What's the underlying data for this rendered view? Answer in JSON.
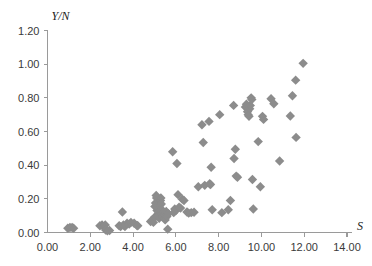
{
  "chart_data": {
    "type": "scatter",
    "title": "",
    "subtitle": "",
    "xlabel": "S",
    "ylabel": "Y/N",
    "xlim": [
      0.0,
      14.0
    ],
    "ylim": [
      0.0,
      1.2
    ],
    "xticks": [
      0.0,
      2.0,
      4.0,
      6.0,
      8.0,
      10.0,
      12.0,
      14.0
    ],
    "yticks": [
      0.0,
      0.2,
      0.4,
      0.6,
      0.8,
      1.0,
      1.2
    ],
    "xtick_labels": [
      "0.00",
      "2.00",
      "4.00",
      "6.00",
      "8.00",
      "10.00",
      "12.00",
      "14.00"
    ],
    "ytick_labels": [
      "0.00",
      "0.20",
      "0.40",
      "0.60",
      "0.80",
      "1.00",
      "1.20"
    ],
    "grid": false,
    "legend": null,
    "legend_position": "none",
    "marker": "diamond",
    "marker_color": "#8c8c8c",
    "marker_size": 7,
    "axis_color": "#9a9a9a",
    "series": [
      {
        "name": "observations",
        "points": [
          [
            0.95,
            0.025
          ],
          [
            1.05,
            0.03
          ],
          [
            1.15,
            0.03
          ],
          [
            1.22,
            0.025
          ],
          [
            2.45,
            0.04
          ],
          [
            2.55,
            0.045
          ],
          [
            2.62,
            0.035
          ],
          [
            2.7,
            0.045
          ],
          [
            2.72,
            0.015
          ],
          [
            2.8,
            0.01
          ],
          [
            2.9,
            0.012
          ],
          [
            3.35,
            0.04
          ],
          [
            3.42,
            0.035
          ],
          [
            3.5,
            0.122
          ],
          [
            3.55,
            0.045
          ],
          [
            3.62,
            0.035
          ],
          [
            3.72,
            0.055
          ],
          [
            3.82,
            0.05
          ],
          [
            3.9,
            0.06
          ],
          [
            4.05,
            0.055
          ],
          [
            4.18,
            0.042
          ],
          [
            4.22,
            0.04
          ],
          [
            4.82,
            0.065
          ],
          [
            4.9,
            0.075
          ],
          [
            4.95,
            0.06
          ],
          [
            5.0,
            0.09
          ],
          [
            5.02,
            0.155
          ],
          [
            5.05,
            0.175
          ],
          [
            5.08,
            0.22
          ],
          [
            5.1,
            0.205
          ],
          [
            5.12,
            0.13
          ],
          [
            5.15,
            0.145
          ],
          [
            5.18,
            0.115
          ],
          [
            5.2,
            0.1
          ],
          [
            5.22,
            0.085
          ],
          [
            5.25,
            0.16
          ],
          [
            5.28,
            0.19
          ],
          [
            5.3,
            0.205
          ],
          [
            5.32,
            0.17
          ],
          [
            5.35,
            0.135
          ],
          [
            5.38,
            0.11
          ],
          [
            5.4,
            0.095
          ],
          [
            5.42,
            0.12
          ],
          [
            5.45,
            0.105
          ],
          [
            5.48,
            0.085
          ],
          [
            5.5,
            0.075
          ],
          [
            5.52,
            0.1
          ],
          [
            5.55,
            0.125
          ],
          [
            5.58,
            0.095
          ],
          [
            5.62,
            0.02
          ],
          [
            5.65,
            0.112
          ],
          [
            5.85,
            0.48
          ],
          [
            5.9,
            0.118
          ],
          [
            5.95,
            0.14
          ],
          [
            6.0,
            0.13
          ],
          [
            6.05,
            0.41
          ],
          [
            6.1,
            0.225
          ],
          [
            6.15,
            0.15
          ],
          [
            6.22,
            0.145
          ],
          [
            6.3,
            0.198
          ],
          [
            6.38,
            0.19
          ],
          [
            6.52,
            0.122
          ],
          [
            6.6,
            0.115
          ],
          [
            6.72,
            0.118
          ],
          [
            6.85,
            0.12
          ],
          [
            7.05,
            0.272
          ],
          [
            7.22,
            0.64
          ],
          [
            7.28,
            0.535
          ],
          [
            7.35,
            0.28
          ],
          [
            7.55,
            0.66
          ],
          [
            7.58,
            0.29
          ],
          [
            7.62,
            0.285
          ],
          [
            7.65,
            0.388
          ],
          [
            7.7,
            0.135
          ],
          [
            8.05,
            0.7
          ],
          [
            8.15,
            0.118
          ],
          [
            8.45,
            0.135
          ],
          [
            8.55,
            0.19
          ],
          [
            8.7,
            0.755
          ],
          [
            8.72,
            0.44
          ],
          [
            8.78,
            0.495
          ],
          [
            8.82,
            0.335
          ],
          [
            8.88,
            0.328
          ],
          [
            9.25,
            0.745
          ],
          [
            9.3,
            0.762
          ],
          [
            9.35,
            0.718
          ],
          [
            9.38,
            0.7
          ],
          [
            9.42,
            0.69
          ],
          [
            9.45,
            0.735
          ],
          [
            9.48,
            0.755
          ],
          [
            9.52,
            0.8
          ],
          [
            9.55,
            0.79
          ],
          [
            9.58,
            0.315
          ],
          [
            9.62,
            0.14
          ],
          [
            9.85,
            0.54
          ],
          [
            9.95,
            0.272
          ],
          [
            10.05,
            0.69
          ],
          [
            10.1,
            0.672
          ],
          [
            10.45,
            0.795
          ],
          [
            10.58,
            0.765
          ],
          [
            10.85,
            0.425
          ],
          [
            11.35,
            0.692
          ],
          [
            11.45,
            0.812
          ],
          [
            11.6,
            0.905
          ],
          [
            11.62,
            0.565
          ],
          [
            11.95,
            1.005
          ]
        ]
      }
    ]
  },
  "axis": {
    "x_title": "S",
    "y_title": "Y/N"
  }
}
